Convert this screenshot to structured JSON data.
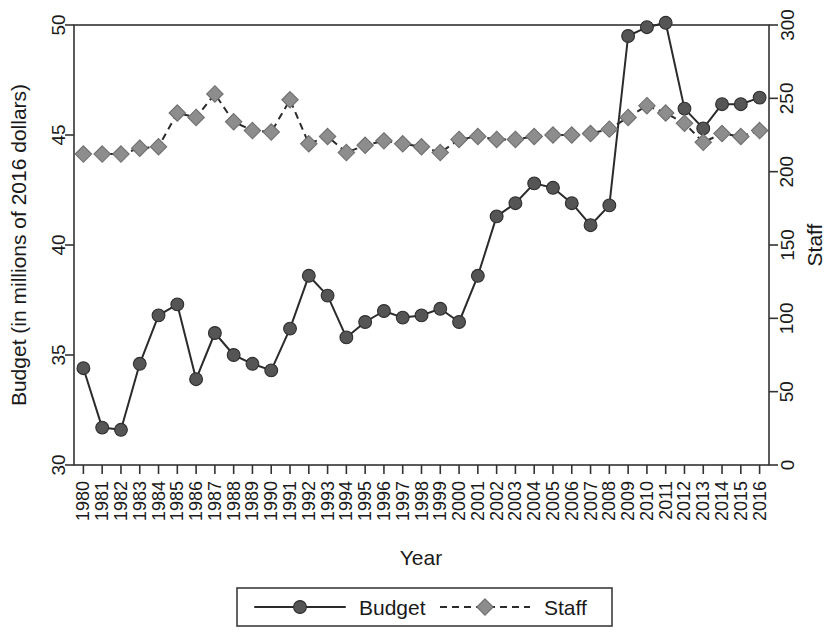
{
  "chart_data": {
    "type": "line",
    "title": "",
    "xlabel": "Year",
    "ylabel": "Budget (in millions of 2016 dollars)",
    "ylabel_right": "Staff",
    "grid": false,
    "legend_position": "bottom-center",
    "x": [
      1980,
      1981,
      1982,
      1983,
      1984,
      1985,
      1986,
      1987,
      1988,
      1989,
      1990,
      1991,
      1992,
      1993,
      1994,
      1995,
      1996,
      1997,
      1998,
      1999,
      2000,
      2001,
      2002,
      2003,
      2004,
      2005,
      2006,
      2007,
      2008,
      2009,
      2010,
      2011,
      2012,
      2013,
      2014,
      2015,
      2016
    ],
    "categories": [
      "1980",
      "1981",
      "1982",
      "1983",
      "1984",
      "1985",
      "1986",
      "1987",
      "1988",
      "1989",
      "1990",
      "1991",
      "1992",
      "1993",
      "1994",
      "1995",
      "1996",
      "1997",
      "1998",
      "1999",
      "2000",
      "2001",
      "2002",
      "2003",
      "2004",
      "2005",
      "2006",
      "2007",
      "2008",
      "2009",
      "2010",
      "2011",
      "2012",
      "2013",
      "2014",
      "2015",
      "2016"
    ],
    "ylim": [
      30,
      50
    ],
    "yticks": [
      30,
      35,
      40,
      45,
      50
    ],
    "ylim_right": [
      0,
      300
    ],
    "yticks_right": [
      0,
      50,
      100,
      150,
      200,
      250,
      300
    ],
    "series": [
      {
        "name": "Budget",
        "axis": "left",
        "unit": "millions of 2016 dollars",
        "marker": "circle",
        "linestyle": "solid",
        "color": "#555555",
        "values": [
          34.4,
          31.7,
          31.6,
          34.6,
          36.8,
          37.3,
          33.9,
          36.0,
          35.0,
          34.6,
          34.3,
          36.2,
          38.6,
          37.7,
          35.8,
          36.5,
          37.0,
          36.7,
          36.8,
          37.1,
          36.5,
          38.6,
          41.3,
          41.9,
          42.8,
          42.6,
          41.9,
          40.9,
          41.8,
          49.5,
          49.9,
          50.1,
          46.2,
          45.3,
          46.4,
          46.4,
          46.7
        ]
      },
      {
        "name": "Staff",
        "axis": "right",
        "unit": "staff",
        "marker": "diamond",
        "linestyle": "dashed",
        "color": "#8d8d8d",
        "values": [
          212,
          212,
          212,
          216,
          217,
          240,
          237,
          253,
          234,
          228,
          227,
          249,
          219,
          224,
          213,
          218,
          221,
          219,
          217,
          213,
          222,
          224,
          222,
          222,
          224,
          225,
          225,
          226,
          229,
          237,
          245,
          240,
          233,
          220,
          226,
          224,
          228
        ]
      }
    ],
    "legend": [
      {
        "label": "Budget",
        "marker": "circle",
        "linestyle": "solid"
      },
      {
        "label": "Staff",
        "marker": "diamond",
        "linestyle": "dashed"
      }
    ]
  }
}
